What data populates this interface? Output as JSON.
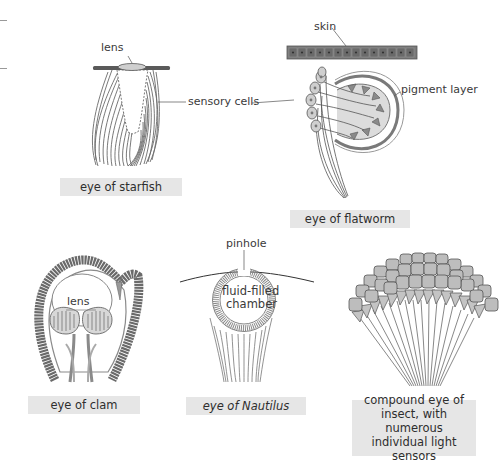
{
  "figures": [
    {
      "id": "starfish",
      "caption": "eye of starfish",
      "labels": {
        "lens": "lens",
        "sensory_cells": "sensory cells"
      }
    },
    {
      "id": "flatworm",
      "caption": "eye of flatworm",
      "labels": {
        "skin": "skin",
        "pigment_layer": "pigment layer"
      }
    },
    {
      "id": "clam",
      "caption": "eye of clam",
      "labels": {
        "lens": "lens"
      }
    },
    {
      "id": "nautilus",
      "caption_prefix": "eye of ",
      "caption_italic": "Nautilus",
      "labels": {
        "pinhole": "pinhole",
        "chamber_line1": "fluid-filled",
        "chamber_line2": "chamber"
      }
    },
    {
      "id": "insect",
      "caption_lines": [
        "compound eye of",
        "insect, with numerous",
        "individual light",
        "sensors"
      ]
    }
  ],
  "colors": {
    "tissue": "#6e6e6e",
    "tissue_light": "#b5b5b5",
    "caption_bg": "#e6e6e6",
    "leader_line": "#555555"
  }
}
